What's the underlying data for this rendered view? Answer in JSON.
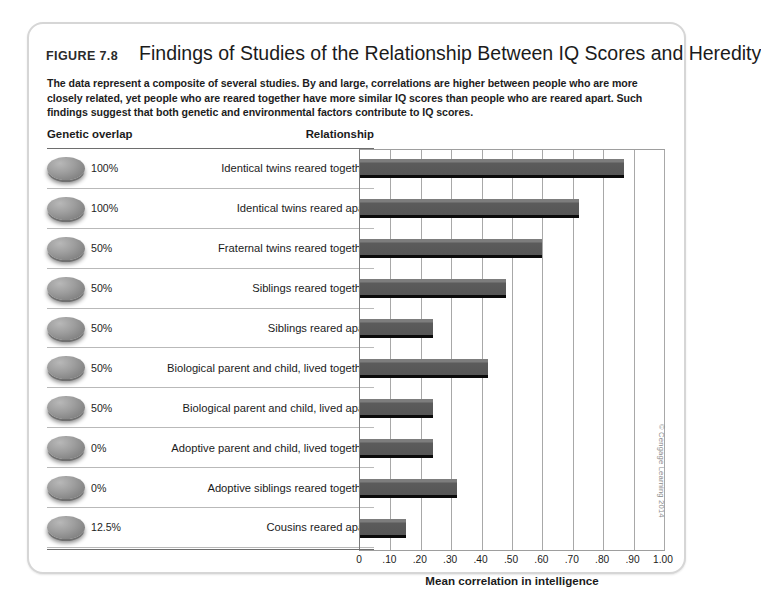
{
  "figure": {
    "number_label": "FIGURE 7.8",
    "title": "Findings of Studies of the Relationship Between IQ Scores and Heredity",
    "caption": "The data represent a composite of several studies. By and large, correlations are higher between people who are more closely related, yet people who are reared together have more similar IQ scores than people who are reared apart. Such findings suggest that both genetic and environmental factors contribute to IQ scores.",
    "copyright": "© Cengage Learning 2014"
  },
  "columns": {
    "genetic_overlap": "Genetic overlap",
    "relationship": "Relationship"
  },
  "chart_data": {
    "type": "bar",
    "orientation": "horizontal",
    "title": "Findings of Studies of the Relationship Between IQ Scores and Heredity",
    "xlabel": "Mean correlation in intelligence",
    "ylabel": "",
    "xlim": [
      0,
      1.0
    ],
    "xticks": [
      0,
      0.1,
      0.2,
      0.3,
      0.4,
      0.5,
      0.6,
      0.7,
      0.8,
      0.9,
      1.0
    ],
    "xtick_labels": [
      "0",
      ".10",
      ".20",
      ".30",
      ".40",
      ".50",
      ".60",
      ".70",
      ".80",
      ".90",
      "1.00"
    ],
    "grid": true,
    "grid_axis": "x",
    "legend": null,
    "bar_color": "#595959",
    "categories": [
      "Identical twins reared together",
      "Identical twins reared apart",
      "Fraternal twins reared together",
      "Siblings reared together",
      "Siblings reared apart",
      "Biological parent and child, lived together",
      "Biological parent and child, lived apart",
      "Adoptive parent and child, lived together",
      "Adoptive siblings reared together",
      "Cousins reared apart"
    ],
    "values": [
      0.87,
      0.72,
      0.6,
      0.48,
      0.24,
      0.42,
      0.24,
      0.24,
      0.32,
      0.15
    ],
    "genetic_overlap": [
      "100%",
      "100%",
      "50%",
      "50%",
      "50%",
      "50%",
      "50%",
      "0%",
      "0%",
      "12.5%"
    ]
  },
  "rows": [
    {
      "overlap": "100%",
      "relationship": "Identical twins reared together",
      "value": 0.87
    },
    {
      "overlap": "100%",
      "relationship": "Identical twins reared apart",
      "value": 0.72
    },
    {
      "overlap": "50%",
      "relationship": "Fraternal twins reared together",
      "value": 0.6
    },
    {
      "overlap": "50%",
      "relationship": "Siblings reared together",
      "value": 0.48
    },
    {
      "overlap": "50%",
      "relationship": "Siblings reared apart",
      "value": 0.24
    },
    {
      "overlap": "50%",
      "relationship": "Biological parent and child, lived together",
      "value": 0.42
    },
    {
      "overlap": "50%",
      "relationship": "Biological parent and child, lived apart",
      "value": 0.24
    },
    {
      "overlap": "0%",
      "relationship": "Adoptive parent and child, lived together",
      "value": 0.24
    },
    {
      "overlap": "0%",
      "relationship": "Adoptive siblings reared together",
      "value": 0.32
    },
    {
      "overlap": "12.5%",
      "relationship": "Cousins reared apart",
      "value": 0.15
    }
  ]
}
